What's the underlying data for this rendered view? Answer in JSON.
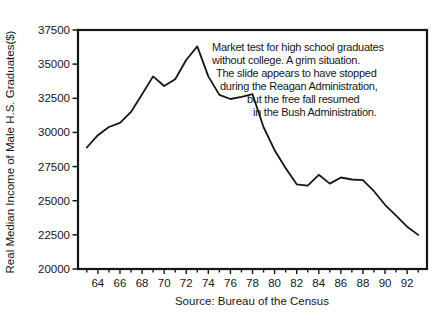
{
  "window": {
    "background": "#ffffff",
    "ink_color": "#161616"
  },
  "chart_data": {
    "type": "line",
    "title": "",
    "ylabel": "Real Median Income of Male H.S. Graduates($)",
    "source_caption": "Source: Bureau of the Census",
    "x": [
      1963,
      1964,
      1965,
      1966,
      1967,
      1968,
      1969,
      1970,
      1971,
      1972,
      1973,
      1974,
      1975,
      1976,
      1977,
      1978,
      1979,
      1980,
      1981,
      1982,
      1983,
      1984,
      1985,
      1986,
      1987,
      1988,
      1989,
      1990,
      1991,
      1992,
      1993
    ],
    "values": [
      28900,
      29800,
      30400,
      30700,
      31500,
      32800,
      34100,
      33400,
      33900,
      35300,
      36300,
      34100,
      32750,
      32450,
      32600,
      32800,
      30400,
      28700,
      27400,
      26200,
      26100,
      26900,
      26250,
      26700,
      26550,
      26500,
      25700,
      24700,
      23900,
      23100,
      22500
    ],
    "ylim": [
      20000,
      37500
    ],
    "ytick_step": 2500,
    "ytick_labels": [
      "20000",
      "22500",
      "25000",
      "27500",
      "30000",
      "32500",
      "35000",
      "37500"
    ],
    "xlim": [
      62.2,
      93.8
    ],
    "xtick_minor_years": [
      63,
      64,
      65,
      66,
      67,
      68,
      69,
      70,
      71,
      72,
      73,
      74,
      75,
      76,
      77,
      78,
      79,
      80,
      81,
      82,
      83,
      84,
      85,
      86,
      87,
      88,
      89,
      90,
      91,
      92,
      93
    ],
    "xtick_labeled_years": [
      64,
      66,
      68,
      70,
      72,
      74,
      76,
      78,
      80,
      82,
      84,
      86,
      88,
      90,
      92
    ],
    "grid": false,
    "legend": null,
    "line_color": "#161616",
    "annotation": {
      "lines": [
        "Market test for high school graduates",
        "without college. A grim situation.",
        "The slide appears to have stopped",
        "during the Reagan Administration,",
        "but the free fall resumed",
        "in the Bush Administration."
      ]
    }
  }
}
